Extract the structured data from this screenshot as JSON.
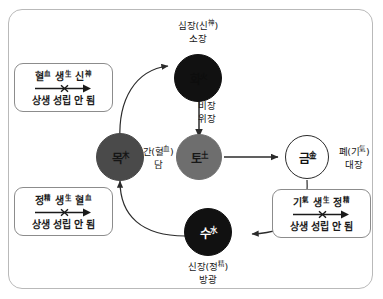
{
  "figure": {
    "border_color": "#b9b9b9",
    "background": "#ffffff"
  },
  "nodes": [
    {
      "id": "fire",
      "text": "화",
      "sup": "火",
      "fill": "#111111",
      "text_color": "#0d0d0d",
      "stroke": "#111111"
    },
    {
      "id": "wood",
      "text": "목",
      "sup": "木",
      "fill": "#4a4a4a",
      "text_color": "#151515",
      "stroke": "#4a4a4a"
    },
    {
      "id": "earth",
      "text": "토",
      "sup": "土",
      "fill": "#6e6e6e",
      "text_color": "#171717",
      "stroke": "#6e6e6e"
    },
    {
      "id": "metal",
      "text": "금",
      "sup": "金",
      "fill": "#ffffff",
      "text_color": "#111111",
      "stroke": "#2b2b2b"
    },
    {
      "id": "water",
      "text": "수",
      "sup": "水",
      "fill": "#111111",
      "text_color": "#ffffff",
      "stroke": "#111111"
    }
  ],
  "organ_labels": {
    "fire": {
      "line1": "심장(신",
      "line1_sup": "神",
      "line1_end": ")",
      "line2": "소장"
    },
    "earth": {
      "line1": "비장",
      "line2": "위장"
    },
    "wood": {
      "line1": "간(혈",
      "line1_sup": "血",
      "line1_end": ")",
      "line2": "담"
    },
    "metal": {
      "line1": "폐(기",
      "line1_sup": "氣",
      "line1_end": ")",
      "line2": "대장"
    },
    "water": {
      "line1": "신장(정",
      "line1_sup": "精",
      "line1_end": ")",
      "line2": "방광"
    }
  },
  "notes": [
    {
      "id": "blood-generates-spirit",
      "a": "혈",
      "a_sup": "血",
      "verb": "생",
      "verb_sup": "生",
      "b": "신",
      "b_sup": "神",
      "conclusion": "상생 성립 안 됨"
    },
    {
      "id": "essence-generates-blood",
      "a": "정",
      "a_sup": "精",
      "verb": "생",
      "verb_sup": "生",
      "b": "혈",
      "b_sup": "血",
      "conclusion": "상생 성립 안 됨"
    },
    {
      "id": "qi-generates-essence",
      "a": "기",
      "a_sup": "氣",
      "verb": "생",
      "verb_sup": "生",
      "b": "정",
      "b_sup": "精",
      "conclusion": "상생 성립 안 됨"
    }
  ],
  "colors": {
    "arrow": "#2b2b2b",
    "note_border": "#8c8c8c",
    "frame_border": "#b9b9b9"
  }
}
